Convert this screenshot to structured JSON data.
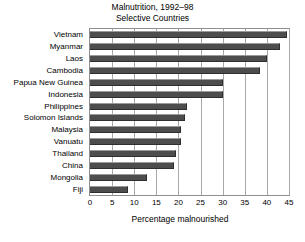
{
  "chart_data": {
    "type": "bar",
    "orientation": "horizontal",
    "title": "Malnutrition, 1992–98\nSelective Countries",
    "title_lines": [
      "Malnutrition, 1992–98",
      "Selective Countries"
    ],
    "xlabel": "Percentage malnourished",
    "ylabel": "",
    "xlim": [
      0,
      45
    ],
    "xticks": [
      0,
      5,
      10,
      15,
      20,
      25,
      30,
      35,
      40,
      45
    ],
    "xtick_labels": [
      "0",
      "5",
      "10",
      "15",
      "20",
      "25",
      "30",
      "35",
      "40",
      "45"
    ],
    "grid": true,
    "grid_axis": "x",
    "legend": false,
    "bar_color": "#4d4d4d",
    "categories": [
      "Vietnam",
      "Myanmar",
      "Laos",
      "Cambodia",
      "Papua New Guinea",
      "Indonesia",
      "Philippines",
      "Solomon Islands",
      "Malaysia",
      "Vanuatu",
      "Thailand",
      "China",
      "Mongolia",
      "Fiji"
    ],
    "values": [
      44.5,
      43,
      40,
      38.5,
      30,
      30,
      22,
      21.5,
      20.5,
      20.5,
      19.5,
      19,
      13,
      8.5
    ]
  }
}
